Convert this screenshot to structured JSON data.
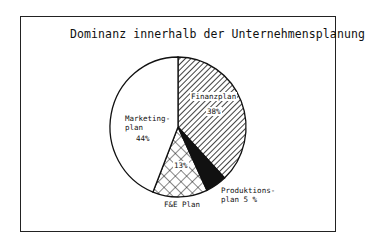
{
  "chart_data": {
    "type": "pie",
    "title": "Dominanz innerhalb der Unternehmensplanung",
    "categories": [
      "Finanzplan",
      "Produktionsplan",
      "F&E Plan",
      "Marketingplan"
    ],
    "values": [
      38,
      5,
      13,
      44
    ],
    "unit": "%",
    "start_angle": "12 o'clock, clockwise",
    "slices": [
      {
        "name": "Finanzplan",
        "label_lines": [
          "Finanzplan"
        ],
        "value_label": "38%",
        "value": 38,
        "fill": "diagonal-hatch"
      },
      {
        "name": "Produktionsplan",
        "label_lines": [
          "Produktions-",
          "plan  5 %"
        ],
        "value": 5,
        "fill": "solid-black"
      },
      {
        "name": "F&E Plan",
        "label_lines": [
          "F&E Plan"
        ],
        "value_label": "13%",
        "value": 13,
        "fill": "cross-hatch"
      },
      {
        "name": "Marketingplan",
        "label_lines": [
          "Marketing-",
          "plan"
        ],
        "value_label": "44%",
        "value": 44,
        "fill": "white"
      }
    ],
    "legend": "none (inline labels)"
  },
  "labels": {
    "title": "Dominanz innerhalb der Unternehmensplanung",
    "finanz": "Finanzplan",
    "finanz_pct": "38%",
    "prod_1": "Produktions-",
    "prod_2": "plan  5 %",
    "fe": "F&E Plan",
    "fe_pct": "13%",
    "mkt_1": "Marketing-",
    "mkt_2": "plan",
    "mkt_pct": "44%"
  }
}
